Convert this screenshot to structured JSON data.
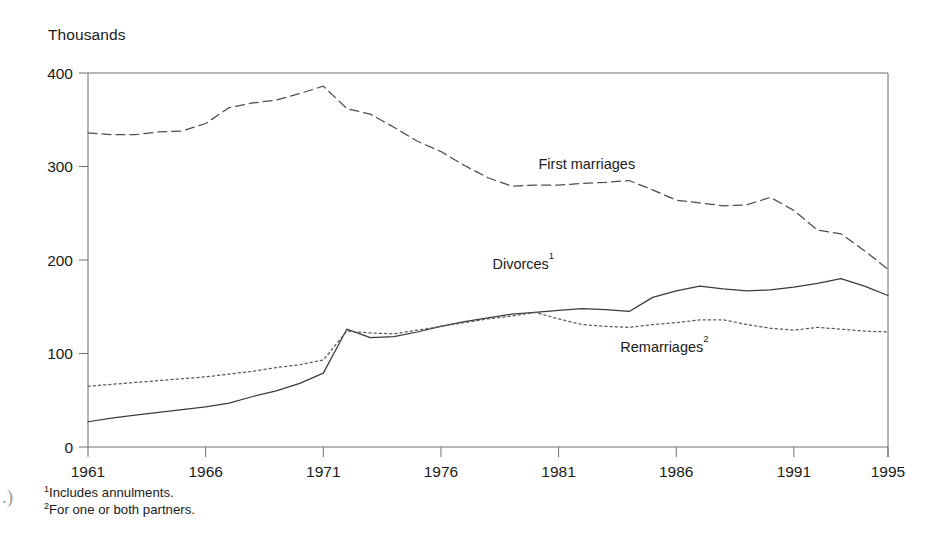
{
  "figure": {
    "unit_label": "Thousands",
    "page_artifact": ".)"
  },
  "footnotes": [
    {
      "marker": "1",
      "text": "Includes annulments."
    },
    {
      "marker": "2",
      "text": "For one or both partners."
    }
  ],
  "chart_data": {
    "type": "line",
    "title": "",
    "subtitle": "",
    "xlabel": "",
    "ylabel": "Thousands",
    "xlim": [
      1961,
      1995
    ],
    "ylim": [
      0,
      400
    ],
    "xticks": [
      1961,
      1966,
      1971,
      1976,
      1981,
      1986,
      1991,
      1995
    ],
    "xtick_labels": [
      "1961",
      "1966",
      "1971",
      "1976",
      "1981",
      "1986",
      "1991",
      "1995"
    ],
    "yticks": [
      0,
      100,
      200,
      300,
      400
    ],
    "ytick_labels": [
      "0",
      "100",
      "200",
      "300",
      "400"
    ],
    "grid": false,
    "legend_position": "inline-annotations",
    "x": [
      1961,
      1962,
      1963,
      1964,
      1965,
      1966,
      1967,
      1968,
      1969,
      1970,
      1971,
      1972,
      1973,
      1974,
      1975,
      1976,
      1977,
      1978,
      1979,
      1980,
      1981,
      1982,
      1983,
      1984,
      1985,
      1986,
      1987,
      1988,
      1989,
      1990,
      1991,
      1992,
      1993,
      1994,
      1995
    ],
    "series": [
      {
        "name": "First marriages",
        "label": "First marriages",
        "footnote": "",
        "style": "dashed",
        "color": "#4d4d4d",
        "label_x": 1982.2,
        "label_y": 297,
        "values": [
          336,
          334,
          334,
          337,
          338,
          346,
          363,
          368,
          371,
          378,
          386,
          362,
          356,
          342,
          327,
          316,
          301,
          288,
          279,
          280,
          280,
          282,
          283,
          285,
          275,
          264,
          261,
          258,
          259,
          267,
          253,
          232,
          228,
          210,
          190
        ]
      },
      {
        "name": "Divorces",
        "label": "Divorces",
        "footnote": "1",
        "style": "solid",
        "color": "#3a3a3a",
        "label_x": 1979.5,
        "label_y": 190,
        "values": [
          27,
          31,
          34,
          37,
          40,
          43,
          47,
          54,
          60,
          68,
          79,
          126,
          117,
          118,
          123,
          129,
          134,
          138,
          142,
          144,
          146,
          148,
          147,
          145,
          160,
          167,
          172,
          169,
          167,
          168,
          171,
          175,
          180,
          172,
          162
        ]
      },
      {
        "name": "Remarriages",
        "label": "Remarriages",
        "footnote": "2",
        "style": "dotted",
        "color": "#5a5a5a",
        "label_x": 1985.5,
        "label_y": 102,
        "values": [
          65,
          67,
          69,
          71,
          73,
          75,
          78,
          81,
          85,
          88,
          93,
          124,
          122,
          121,
          125,
          129,
          133,
          137,
          140,
          144,
          137,
          131,
          129,
          128,
          131,
          133,
          136,
          136,
          131,
          127,
          125,
          128,
          126,
          124,
          123
        ]
      }
    ]
  }
}
